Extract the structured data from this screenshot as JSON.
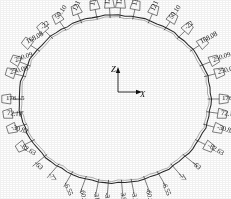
{
  "figure": {
    "type": "engineering-ring-callout-diagram",
    "axes": {
      "vertical_label": "Z",
      "horizontal_label": "X"
    },
    "ring": {
      "center": [
        115,
        99
      ],
      "radius_x": 96,
      "radius_y": 84,
      "stroke": "#2b2b2b"
    },
    "callouts": [
      {
        "id": "r-000",
        "value": "-3.33",
        "angle_deg": 94,
        "side": "bottom",
        "rot": 82
      },
      {
        "id": "r-001",
        "value": "3.97",
        "angle_deg": 86,
        "side": "bottom",
        "rot": 82
      },
      {
        "id": "r-002",
        "value": "-31.97",
        "angle_deg": 100,
        "side": "bottom",
        "rot": 80
      },
      {
        "id": "r-003",
        "value": "-3.33",
        "angle_deg": 80,
        "side": "bottom",
        "rot": 80
      },
      {
        "id": "r-004",
        "value": "-60.00",
        "angle_deg": 108,
        "side": "bottom",
        "rot": 76
      },
      {
        "id": "r-005",
        "value": "-60.00",
        "angle_deg": 72,
        "side": "bottom",
        "rot": 76
      },
      {
        "id": "r-006",
        "value": "-6.55",
        "angle_deg": 117,
        "side": "bottom",
        "rot": 68
      },
      {
        "id": "r-007",
        "value": "-6.55",
        "angle_deg": 63,
        "side": "bottom",
        "rot": 68
      },
      {
        "id": "r-008",
        "value": "-77",
        "angle_deg": 127,
        "side": "bottom",
        "rot": 58
      },
      {
        "id": "r-009",
        "value": "-77",
        "angle_deg": 53,
        "side": "bottom",
        "rot": 58
      },
      {
        "id": "r-010",
        "value": "-63",
        "angle_deg": 137,
        "side": "bottom",
        "rot": 46
      },
      {
        "id": "r-011",
        "value": "-63",
        "angle_deg": 43,
        "side": "bottom",
        "rot": 46
      },
      {
        "id": "r-012",
        "value": "-82.63",
        "angle_deg": 150,
        "side": "lower",
        "rot": 30
      },
      {
        "id": "r-013",
        "value": "-82.63",
        "angle_deg": 30,
        "side": "lower",
        "rot": 30
      },
      {
        "id": "r-014",
        "value": "-30.82",
        "angle_deg": 162,
        "side": "lower",
        "rot": 16
      },
      {
        "id": "r-015",
        "value": "-30.82",
        "angle_deg": 18,
        "side": "lower",
        "rot": 16
      },
      {
        "id": "r-016",
        "value": "72.10",
        "angle_deg": 171,
        "side": "lower",
        "rot": 6
      },
      {
        "id": "r-017",
        "value": "72.10",
        "angle_deg": 9,
        "side": "lower",
        "rot": 6
      },
      {
        "id": "r-018",
        "value": "176.15",
        "angle_deg": 180,
        "side": "mid",
        "rot": 0
      },
      {
        "id": "r-019",
        "value": "176.15",
        "angle_deg": 0,
        "side": "mid",
        "rot": 0
      },
      {
        "id": "r-020",
        "value": "250.09",
        "angle_deg": 196,
        "side": "upper",
        "rot": -12
      },
      {
        "id": "r-021",
        "value": "250.09",
        "angle_deg": 344,
        "side": "upper",
        "rot": -12
      },
      {
        "id": "r-022",
        "value": "250.09",
        "angle_deg": 204,
        "side": "upper",
        "rot": -18
      },
      {
        "id": "r-023",
        "value": "250.09",
        "angle_deg": 336,
        "side": "upper",
        "rot": -18
      },
      {
        "id": "r-024",
        "value": "168.08",
        "angle_deg": 216,
        "side": "upper",
        "rot": -28
      },
      {
        "id": "r-025",
        "value": "168.08",
        "angle_deg": 324,
        "side": "upper",
        "rot": -28
      },
      {
        "id": "r-026",
        "value": "-22",
        "angle_deg": 228,
        "side": "upper",
        "rot": -42
      },
      {
        "id": "r-027",
        "value": "-22",
        "angle_deg": 312,
        "side": "upper",
        "rot": -42
      },
      {
        "id": "r-028",
        "value": "50.10",
        "angle_deg": 238,
        "side": "top",
        "rot": -54
      },
      {
        "id": "r-029",
        "value": "50.10",
        "angle_deg": 302,
        "side": "top",
        "rot": -54
      },
      {
        "id": "r-030",
        "value": "121",
        "angle_deg": 249,
        "side": "top",
        "rot": -66
      },
      {
        "id": "r-031",
        "value": "121",
        "angle_deg": 291,
        "side": "top",
        "rot": -66
      },
      {
        "id": "r-032",
        "value": "134",
        "angle_deg": 259,
        "side": "top",
        "rot": -76
      },
      {
        "id": "r-033",
        "value": "134",
        "angle_deg": 281,
        "side": "top",
        "rot": -76
      },
      {
        "id": "r-034",
        "value": "121",
        "angle_deg": 267,
        "side": "top",
        "rot": -86
      },
      {
        "id": "r-035",
        "value": "121",
        "angle_deg": 273,
        "side": "top",
        "rot": -86
      }
    ]
  }
}
